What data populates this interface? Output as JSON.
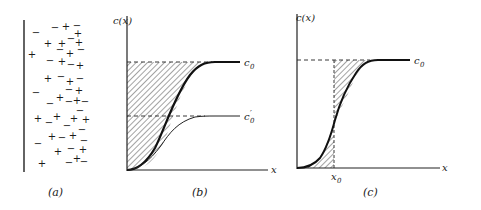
{
  "panels": {
    "a": {
      "caption": "(a)",
      "charges": [
        {
          "s": "−",
          "x": 36,
          "y": 36
        },
        {
          "s": "−",
          "x": 55,
          "y": 31
        },
        {
          "s": "+",
          "x": 66,
          "y": 30
        },
        {
          "s": "−",
          "x": 77,
          "y": 29
        },
        {
          "s": "+",
          "x": 78,
          "y": 37
        },
        {
          "s": "+",
          "x": 48,
          "y": 47
        },
        {
          "s": "+",
          "x": 62,
          "y": 47
        },
        {
          "s": "−",
          "x": 71,
          "y": 42
        },
        {
          "s": "+",
          "x": 79,
          "y": 46
        },
        {
          "s": "+",
          "x": 32,
          "y": 58
        },
        {
          "s": "−",
          "x": 60,
          "y": 53
        },
        {
          "s": "+",
          "x": 70,
          "y": 57
        },
        {
          "s": "−",
          "x": 81,
          "y": 53
        },
        {
          "s": "−",
          "x": 50,
          "y": 64
        },
        {
          "s": "+",
          "x": 62,
          "y": 65
        },
        {
          "s": "−",
          "x": 71,
          "y": 68
        },
        {
          "s": "+",
          "x": 80,
          "y": 69
        },
        {
          "s": "+",
          "x": 48,
          "y": 82
        },
        {
          "s": "−",
          "x": 61,
          "y": 80
        },
        {
          "s": "+",
          "x": 70,
          "y": 85
        },
        {
          "s": "−",
          "x": 80,
          "y": 82
        },
        {
          "s": "−",
          "x": 36,
          "y": 96
        },
        {
          "s": "−",
          "x": 69,
          "y": 93
        },
        {
          "s": "+",
          "x": 79,
          "y": 94
        },
        {
          "s": "−",
          "x": 50,
          "y": 107
        },
        {
          "s": "+",
          "x": 60,
          "y": 101
        },
        {
          "s": "−",
          "x": 69,
          "y": 105
        },
        {
          "s": "+",
          "x": 77,
          "y": 104
        },
        {
          "s": "−",
          "x": 85,
          "y": 105
        },
        {
          "s": "−",
          "x": 80,
          "y": 114
        },
        {
          "s": "+",
          "x": 38,
          "y": 122
        },
        {
          "s": "−",
          "x": 49,
          "y": 126
        },
        {
          "s": "+",
          "x": 57,
          "y": 120
        },
        {
          "s": "+",
          "x": 74,
          "y": 122
        },
        {
          "s": "−",
          "x": 67,
          "y": 129
        },
        {
          "s": "+",
          "x": 86,
          "y": 123
        },
        {
          "s": "+",
          "x": 52,
          "y": 140
        },
        {
          "s": "−",
          "x": 62,
          "y": 141
        },
        {
          "s": "+",
          "x": 73,
          "y": 139
        },
        {
          "s": "−",
          "x": 82,
          "y": 133
        },
        {
          "s": "−",
          "x": 84,
          "y": 144
        },
        {
          "s": "−",
          "x": 38,
          "y": 147
        },
        {
          "s": "+",
          "x": 58,
          "y": 155
        },
        {
          "s": "−",
          "x": 71,
          "y": 152
        },
        {
          "s": "+",
          "x": 83,
          "y": 153
        },
        {
          "s": "+",
          "x": 42,
          "y": 167
        },
        {
          "s": "−",
          "x": 69,
          "y": 166
        },
        {
          "s": "+",
          "x": 77,
          "y": 162
        },
        {
          "s": "−",
          "x": 84,
          "y": 165
        }
      ]
    },
    "b": {
      "caption": "(b)",
      "y_label": "c(x)",
      "x_label": "x",
      "curve_labels": {
        "c0": "c",
        "c0_sub": "0",
        "c0p": "c",
        "c0p_sub": "0",
        "c0p_prime": "′"
      }
    },
    "c": {
      "caption": "(c)",
      "y_label": "c(x)",
      "x_label": "x",
      "curve_label": "c",
      "curve_label_sub": "0",
      "x0_label": "x",
      "x0_sub": "0"
    }
  },
  "chart_data": {
    "type": "line",
    "panels": [
      {
        "id": "b",
        "series": [
          {
            "name": "c0 (thick)",
            "shape": "sigmoid",
            "plateau": "c0"
          },
          {
            "name": "c0' (thin)",
            "shape": "sigmoid",
            "plateau": "c0'"
          }
        ],
        "shaded": "area between c0 line and thick curve",
        "xlabel": "x",
        "ylabel": "c(x)"
      },
      {
        "id": "c",
        "series": [
          {
            "name": "c0",
            "shape": "sigmoid",
            "plateau": "c0"
          }
        ],
        "shaded": "equal areas either side of x0",
        "xlabel": "x",
        "ylabel": "c(x)",
        "marker": "x0"
      }
    ]
  }
}
